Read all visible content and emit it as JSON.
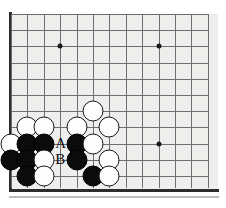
{
  "board": {
    "type": "go-board-diagram",
    "game": "Go",
    "view": "bottom-left corner section",
    "grid": {
      "cols": 13,
      "rows": 11,
      "spacing_x": 16.4,
      "spacing_y": 16.2,
      "origin_x": 11,
      "origin_y": 14
    },
    "background_color": "#eeeeec",
    "line_color": "#6f6f70",
    "edge_color": "#2c2c2c",
    "black_color": "#0b0b0b",
    "white_color": "#fdfdfd",
    "star_points": [
      {
        "col": 3,
        "row": 2,
        "name": "hoshi-upper-left"
      },
      {
        "col": 9,
        "row": 2,
        "name": "hoshi-upper-right"
      },
      {
        "col": 9,
        "row": 8,
        "name": "hoshi-lower-right"
      }
    ],
    "stones": [
      {
        "col": 5,
        "row": 6,
        "color": "white"
      },
      {
        "col": 1,
        "row": 7,
        "color": "white"
      },
      {
        "col": 2,
        "row": 7,
        "color": "white"
      },
      {
        "col": 4,
        "row": 7,
        "color": "white"
      },
      {
        "col": 6,
        "row": 7,
        "color": "white"
      },
      {
        "col": 0,
        "row": 8,
        "color": "white"
      },
      {
        "col": 1,
        "row": 8,
        "color": "black"
      },
      {
        "col": 2,
        "row": 8,
        "color": "black"
      },
      {
        "col": 4,
        "row": 8,
        "color": "black"
      },
      {
        "col": 5,
        "row": 8,
        "color": "white"
      },
      {
        "col": 0,
        "row": 9,
        "color": "black"
      },
      {
        "col": 1,
        "row": 9,
        "color": "black"
      },
      {
        "col": 2,
        "row": 9,
        "color": "white"
      },
      {
        "col": 4,
        "row": 9,
        "color": "black"
      },
      {
        "col": 6,
        "row": 9,
        "color": "white"
      },
      {
        "col": 1,
        "row": 10,
        "color": "black"
      },
      {
        "col": 2,
        "row": 10,
        "color": "white"
      },
      {
        "col": 5,
        "row": 10,
        "color": "black"
      },
      {
        "col": 6,
        "row": 10,
        "color": "white"
      }
    ],
    "markers": [
      {
        "col": 3,
        "row": 8,
        "label": "A",
        "name": "point-label-a"
      },
      {
        "col": 3,
        "row": 9,
        "label": "B",
        "name": "point-label-b"
      }
    ]
  }
}
